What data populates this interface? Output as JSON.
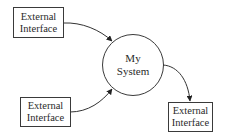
{
  "diagram": {
    "type": "context-diagram",
    "center": {
      "line1": "My",
      "line2": "System"
    },
    "nodes": [
      {
        "id": "ext1",
        "line1": "External",
        "line2": "Interface"
      },
      {
        "id": "ext2",
        "line1": "External",
        "line2": "Interface"
      },
      {
        "id": "ext3",
        "line1": "External",
        "line2": "Interface"
      }
    ],
    "edges": [
      {
        "from": "ext1",
        "to": "center"
      },
      {
        "from": "ext2",
        "to": "center"
      },
      {
        "from": "center",
        "to": "ext3"
      }
    ],
    "colors": {
      "stroke": "#3a3a3a",
      "text": "#2a2a2a",
      "background": "#ffffff"
    }
  }
}
